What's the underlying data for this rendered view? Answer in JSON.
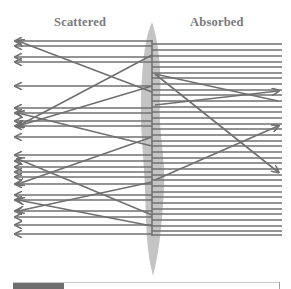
{
  "labels": {
    "left": "Scattered",
    "right": "Absorbed"
  },
  "colors": {
    "line": "#707070",
    "surface": "#c4c4c4",
    "label": "#7a7a7a",
    "bar_fill": "#6e6e6e",
    "bar_track": "#c8c8c8"
  },
  "geometry": {
    "surface_x": 152,
    "right_end_x": 282,
    "left_end_x": 16
  },
  "right_lines_y": [
    44,
    50,
    56,
    62,
    67,
    73,
    78,
    84,
    90,
    95,
    101,
    107,
    112,
    118,
    124,
    129,
    135,
    141,
    146,
    152,
    158,
    163,
    169,
    175,
    180,
    186,
    192,
    197,
    203,
    209,
    214,
    220,
    226,
    231,
    235
  ],
  "left_arrows_y": [
    41,
    46,
    57,
    62,
    86,
    108,
    113,
    121,
    126,
    137,
    155,
    161,
    167,
    172,
    177,
    184,
    195,
    200,
    211,
    217,
    225,
    234
  ],
  "diagonals": [
    {
      "x1": 152,
      "y1": 92,
      "x2": 18,
      "y2": 41,
      "arrow": "end"
    },
    {
      "x1": 152,
      "y1": 86,
      "x2": 18,
      "y2": 126,
      "arrow": "end"
    },
    {
      "x1": 152,
      "y1": 55,
      "x2": 18,
      "y2": 126,
      "arrow": "end"
    },
    {
      "x1": 152,
      "y1": 146,
      "x2": 18,
      "y2": 113,
      "arrow": "end"
    },
    {
      "x1": 152,
      "y1": 137,
      "x2": 18,
      "y2": 184,
      "arrow": "end"
    },
    {
      "x1": 152,
      "y1": 182,
      "x2": 18,
      "y2": 211,
      "arrow": "end"
    },
    {
      "x1": 152,
      "y1": 226,
      "x2": 18,
      "y2": 200,
      "arrow": "end"
    },
    {
      "x1": 152,
      "y1": 215,
      "x2": 18,
      "y2": 159,
      "arrow": "end"
    },
    {
      "x1": 155,
      "y1": 74,
      "x2": 278,
      "y2": 101,
      "arrow": "none"
    },
    {
      "x1": 155,
      "y1": 105,
      "x2": 278,
      "y2": 91,
      "arrow": "end"
    },
    {
      "x1": 155,
      "y1": 74,
      "x2": 278,
      "y2": 172,
      "arrow": "end"
    },
    {
      "x1": 155,
      "y1": 180,
      "x2": 278,
      "y2": 126,
      "arrow": "end"
    }
  ],
  "progress": {
    "fill_percent": 19
  }
}
